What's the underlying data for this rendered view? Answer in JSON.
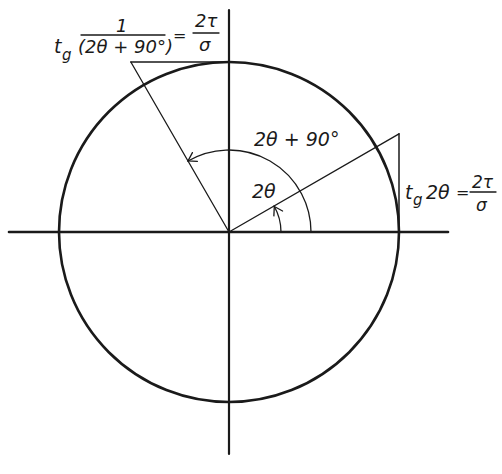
{
  "figure": {
    "type": "Mohr-style unit circle diagram for principal stress angle",
    "ink_color": "#1a1a1a",
    "background_color": "#ffffff",
    "angles_deg": {
      "two_theta": 30,
      "two_theta_plus_90": 120
    },
    "labels": {
      "angle_small": "2θ",
      "angle_large": "2θ + 90°",
      "right_eq_lhs_tg": "t",
      "right_eq_lhs_sub": "g",
      "right_eq_lhs_arg": "2θ",
      "right_eq_equals": "=",
      "right_eq_num": "2τ",
      "right_eq_den": "σ",
      "left_eq_num": "1",
      "left_eq_tg": "t",
      "left_eq_sub": "g",
      "left_eq_arg": "(2θ + 90°)",
      "left_eq_equals": "=",
      "left_eq_rhs_num": "2τ",
      "left_eq_rhs_den": "σ"
    }
  }
}
